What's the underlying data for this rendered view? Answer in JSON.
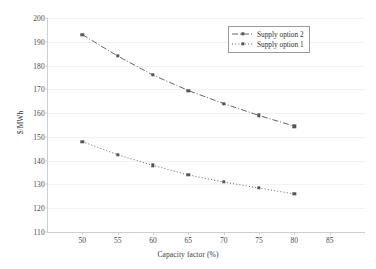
{
  "chart_data": {
    "type": "line",
    "title": "",
    "xlabel": "Capacity factor (%)",
    "ylabel": "$/MWh",
    "xlim": [
      45,
      90
    ],
    "ylim": [
      110,
      200
    ],
    "xticks": [
      50,
      55,
      60,
      65,
      70,
      75,
      80,
      85
    ],
    "yticks": [
      110,
      120,
      130,
      140,
      150,
      160,
      170,
      180,
      190,
      200
    ],
    "grid": true,
    "legend_position": "top-right",
    "x": [
      50,
      55,
      60,
      65,
      70,
      75,
      80
    ],
    "series": [
      {
        "name": "Supply option 2",
        "values": [
          193.0,
          184.0,
          176.0,
          169.5,
          164.0,
          159.0,
          154.5
        ],
        "linestyle": "dash-dot",
        "marker": "square",
        "color": "#55555e"
      },
      {
        "name": "Supply option 1",
        "values": [
          148.0,
          142.5,
          138.0,
          134.0,
          131.0,
          128.5,
          126.0
        ],
        "linestyle": "dotted",
        "marker": "square",
        "color": "#55555e"
      }
    ]
  },
  "axis": {
    "x_title": "Capacity factor (%)",
    "y_title": "$/MWh",
    "x_tick_labels": [
      "50",
      "55",
      "60",
      "65",
      "70",
      "75",
      "80",
      "85"
    ],
    "y_tick_labels": [
      "110",
      "120",
      "130",
      "140",
      "150",
      "160",
      "170",
      "180",
      "190",
      "200"
    ]
  },
  "legend": {
    "items": [
      {
        "label": "Supply option 2"
      },
      {
        "label": "Supply option 1"
      }
    ]
  }
}
